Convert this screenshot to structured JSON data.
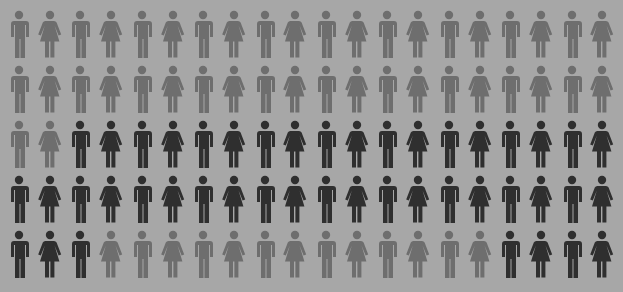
{
  "chart_data": {
    "type": "pictogram",
    "title": "",
    "rows": 5,
    "columns": 20,
    "total": 100,
    "highlighted_count": 45,
    "unit": "person",
    "gender_pattern": "alternating, odd columns male, even columns female",
    "colors": {
      "background": "#a7a7a7",
      "light": "#6e6e6e",
      "dark": "#2f2f2f"
    },
    "grid": [
      [
        "L",
        "L",
        "L",
        "L",
        "L",
        "L",
        "L",
        "L",
        "L",
        "L",
        "L",
        "L",
        "L",
        "L",
        "L",
        "L",
        "L",
        "L",
        "L",
        "L"
      ],
      [
        "L",
        "L",
        "L",
        "L",
        "L",
        "L",
        "L",
        "L",
        "L",
        "L",
        "L",
        "L",
        "L",
        "L",
        "L",
        "L",
        "L",
        "L",
        "L",
        "L"
      ],
      [
        "L",
        "L",
        "D",
        "D",
        "D",
        "D",
        "D",
        "D",
        "D",
        "D",
        "D",
        "D",
        "D",
        "D",
        "D",
        "D",
        "D",
        "D",
        "D",
        "D"
      ],
      [
        "D",
        "D",
        "D",
        "D",
        "D",
        "D",
        "D",
        "D",
        "D",
        "D",
        "D",
        "D",
        "D",
        "D",
        "D",
        "D",
        "D",
        "D",
        "D",
        "D"
      ],
      [
        "D",
        "D",
        "D",
        "L",
        "L",
        "L",
        "L",
        "L",
        "L",
        "L",
        "L",
        "L",
        "L",
        "L",
        "L",
        "L",
        "D",
        "D",
        "D",
        "D"
      ]
    ],
    "layout": {
      "x0": 6,
      "dx": 30.7,
      "y0": 10,
      "dy": 55
    }
  }
}
